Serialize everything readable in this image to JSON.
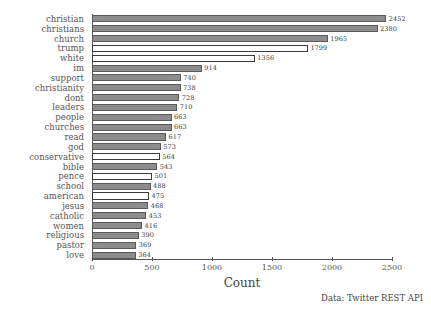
{
  "chart_data": {
    "type": "bar",
    "orientation": "horizontal",
    "title": "",
    "xlabel": "Count",
    "ylabel": "",
    "xlim": [
      0,
      2500
    ],
    "xticks": [
      0,
      500,
      1000,
      1500,
      2000,
      2500
    ],
    "grid": false,
    "legend": null,
    "annotations": [
      "Data: Twitter REST API"
    ],
    "categories": [
      "christian",
      "christians",
      "church",
      "trump",
      "white",
      "im",
      "support",
      "christianity",
      "dont",
      "leaders",
      "people",
      "churches",
      "read",
      "god",
      "conservative",
      "bible",
      "pence",
      "school",
      "american",
      "jesus",
      "catholic",
      "women",
      "religious",
      "pastor",
      "love"
    ],
    "values": [
      2452,
      2380,
      1965,
      1799,
      1356,
      914,
      740,
      738,
      728,
      710,
      663,
      663,
      617,
      573,
      564,
      543,
      501,
      488,
      475,
      468,
      453,
      416,
      390,
      369,
      364
    ],
    "bar_styles": [
      "filled",
      "filled",
      "filled",
      "hollow",
      "hollow",
      "filled",
      "filled",
      "filled",
      "filled",
      "filled",
      "filled",
      "filled",
      "filled",
      "filled",
      "hollow",
      "filled",
      "hollow",
      "filled",
      "hollow",
      "filled",
      "filled",
      "filled",
      "filled",
      "filled",
      "filled"
    ],
    "colors": {
      "bar_fill": "#8c8c8c",
      "bar_edge": "#4a4a4a",
      "hollow_fill": "#ffffff",
      "axis": "#555555",
      "text": "#444444",
      "background": "#ffffff"
    }
  },
  "footer": {
    "source": "Data: Twitter REST API"
  },
  "axis": {
    "x_title": "Count"
  }
}
